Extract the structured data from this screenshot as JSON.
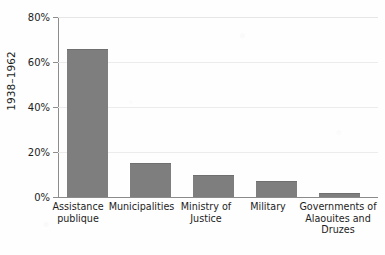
{
  "chart_data": {
    "type": "bar",
    "title": "",
    "subtitle": "",
    "xlabel": "",
    "ylabel": "1938–1962",
    "categories": [
      "Assistance publique",
      "Municipalities",
      "Ministry of Justice",
      "Military",
      "Governments of Alaouites and Druzes"
    ],
    "category_lines": [
      "Assistance\npublique",
      "Municipalities",
      "Ministry of\nJustice",
      "Military",
      "Governments of\nAlaouites and\nDruzes"
    ],
    "values": [
      66,
      15,
      10,
      7,
      2
    ],
    "ylim": [
      0,
      80
    ],
    "yticks": [
      0,
      20,
      40,
      60,
      80
    ],
    "ytick_labels": [
      "0%",
      "20%",
      "40%",
      "60%",
      "80%"
    ],
    "grid": true,
    "grid_axis": "y",
    "legend": "none",
    "bar_color": "#7e7e7e",
    "gridline_color": "#ececed",
    "axis_color": "#8d8d8d",
    "text_color": "#1d1d1d",
    "background_color": "#fefefe"
  },
  "axes": {
    "y_title": "1938–1962"
  }
}
